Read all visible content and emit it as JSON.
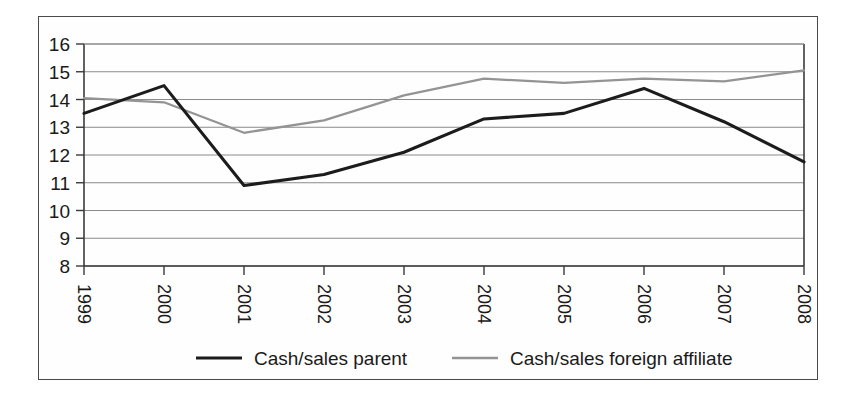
{
  "chart_data": {
    "type": "line",
    "title": "",
    "xlabel": "",
    "ylabel": "",
    "categories": [
      "1999",
      "2000",
      "2001",
      "2002",
      "2003",
      "2004",
      "2005",
      "2006",
      "2007",
      "2008"
    ],
    "x": [
      1999,
      2000,
      2001,
      2002,
      2003,
      2004,
      2005,
      2006,
      2007,
      2008
    ],
    "ylim": [
      8,
      16
    ],
    "xlim": [
      1999,
      2008
    ],
    "yticks": [
      8,
      9,
      10,
      11,
      12,
      13,
      14,
      15,
      16
    ],
    "ytick_labels": [
      "8",
      "9",
      "10",
      "11",
      "12",
      "13",
      "14",
      "15",
      "16"
    ],
    "grid": true,
    "grid_axis": "y",
    "legend_position": "bottom",
    "series": [
      {
        "name": "Cash/sales parent",
        "color": "#1c1c1c",
        "line_width": 3.1,
        "values": [
          13.5,
          14.5,
          10.9,
          11.3,
          12.1,
          13.3,
          13.5,
          14.4,
          13.2,
          11.75
        ]
      },
      {
        "name": "Cash/sales foreign affiliate",
        "color": "#949494",
        "line_width": 2.3,
        "values": [
          14.05,
          13.9,
          12.8,
          13.25,
          14.15,
          14.75,
          14.6,
          14.75,
          14.65,
          15.05
        ]
      }
    ]
  },
  "legend": {
    "items": [
      {
        "label": "Cash/sales parent",
        "color": "#1c1c1c",
        "width": 3.1
      },
      {
        "label": "Cash/sales foreign affiliate",
        "color": "#949494",
        "width": 2.3
      }
    ]
  },
  "colors": {
    "parent": "#1c1c1c",
    "affiliate": "#949494",
    "grid": "#8a8a8a",
    "axis": "#3a3a3a",
    "frame": "#4a4a4a",
    "background": "#ffffff"
  }
}
